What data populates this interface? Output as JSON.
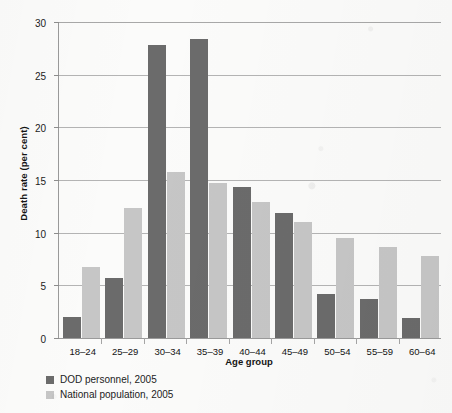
{
  "chart_data": {
    "type": "bar",
    "title": "",
    "subtitle": "",
    "xlabel": "Age group",
    "ylabel": "Death rate (per cent)",
    "categories": [
      "18–24",
      "25–29",
      "30–34",
      "35–39",
      "40–44",
      "45–49",
      "50–54",
      "55–59",
      "60–64"
    ],
    "series": [
      {
        "name": "DOD personnel, 2005",
        "color": "#6b6b6b",
        "values": [
          2.0,
          5.7,
          27.8,
          28.4,
          14.3,
          11.9,
          4.2,
          3.7,
          1.9
        ]
      },
      {
        "name": "National population, 2005",
        "color": "#c6c6c6",
        "values": [
          6.7,
          12.3,
          15.8,
          14.7,
          12.9,
          11.0,
          9.5,
          8.6,
          7.8
        ]
      }
    ],
    "ylim": [
      0,
      30
    ],
    "yticks": [
      0,
      5,
      10,
      15,
      20,
      25,
      30
    ],
    "ytick_labels": [
      "0",
      "5",
      "10",
      "15",
      "20",
      "25",
      "30"
    ],
    "grid": "horizontal",
    "legend_position": "bottom-left",
    "axis_color": "#9a9a9a",
    "grid_color": "#b4b4b4",
    "background_color": "#fbfbfa"
  }
}
